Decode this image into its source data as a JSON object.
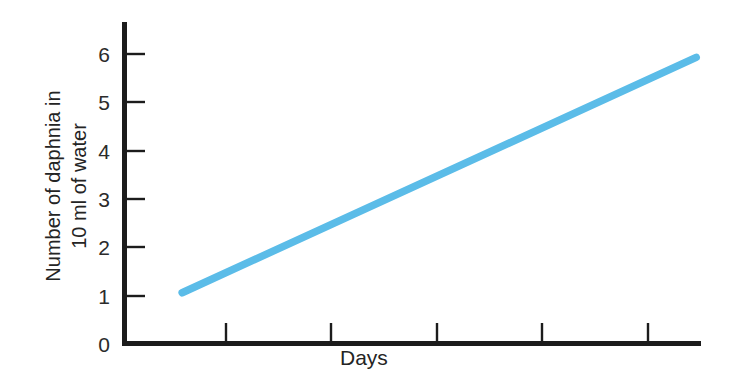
{
  "chart_data": {
    "type": "line",
    "title": "",
    "subtitle": "",
    "xlabel": "Days",
    "ylabel": "Number of daphnia in 10 ml of water",
    "ylabel_line1": "Number of daphnia in",
    "ylabel_line2": "10 ml of water",
    "ylim": [
      0,
      6.4
    ],
    "xlim": [
      0,
      12
    ],
    "yticks": [
      0,
      1,
      2,
      3,
      4,
      5,
      6
    ],
    "ytick_labels": [
      "0",
      "1",
      "2",
      "3",
      "4",
      "5",
      "6"
    ],
    "xticks": [
      2,
      4,
      6,
      8,
      10
    ],
    "xtick_labels": [
      "",
      "",
      "",
      "",
      ""
    ],
    "grid": false,
    "legend": "none",
    "series": [
      {
        "name": "daphnia population",
        "color": "#5bbce8",
        "x": [
          1.2,
          11.9
        ],
        "values": [
          1.05,
          5.92
        ]
      }
    ],
    "annotations": []
  },
  "axes": {
    "line_color": "#1c1c1c",
    "background": "#ffffff"
  },
  "labels": {
    "y_ticks": [
      "6",
      "5",
      "4",
      "3",
      "2",
      "1",
      "0"
    ],
    "x_axis_title": "Days"
  }
}
